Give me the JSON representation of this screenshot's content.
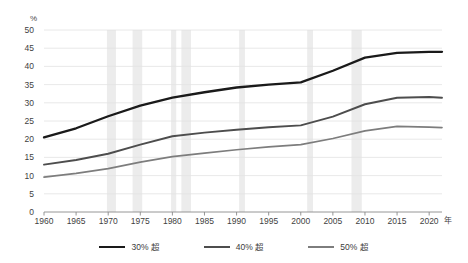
{
  "chart_data": {
    "type": "line",
    "title": "",
    "xlabel": "年",
    "ylabel": "%",
    "xlim": [
      1960,
      2022
    ],
    "ylim": [
      0,
      50
    ],
    "grid": true,
    "legend_position": "bottom",
    "x_ticks": [
      "1960",
      "1965",
      "1970",
      "1975",
      "1980",
      "1985",
      "1990",
      "1995",
      "2000",
      "2005",
      "2010",
      "2015",
      "2020"
    ],
    "y_ticks": [
      "0",
      "5",
      "10",
      "15",
      "20",
      "25",
      "30",
      "35",
      "40",
      "45",
      "50"
    ],
    "x": [
      1960,
      1965,
      1970,
      1975,
      1980,
      1985,
      1990,
      1995,
      2000,
      2005,
      2010,
      2015,
      2020,
      2022
    ],
    "series": [
      {
        "name": "30% 超",
        "color": "#1a1a1a",
        "values": [
          20.5,
          23.0,
          26.3,
          29.2,
          31.4,
          32.9,
          34.2,
          35.0,
          35.6,
          38.8,
          42.4,
          43.7,
          44.0,
          44.0
        ]
      },
      {
        "name": "40% 超",
        "color": "#4d4d4d",
        "values": [
          13.0,
          14.3,
          16.0,
          18.5,
          20.8,
          21.8,
          22.6,
          23.3,
          23.8,
          26.2,
          29.6,
          31.4,
          31.6,
          31.4
        ]
      },
      {
        "name": "50% 超",
        "color": "#7d7d7d",
        "values": [
          9.6,
          10.6,
          11.9,
          13.7,
          15.2,
          16.2,
          17.1,
          17.9,
          18.5,
          20.2,
          22.3,
          23.5,
          23.3,
          23.2
        ]
      }
    ],
    "shaded_bands": [
      {
        "start": 1969.8,
        "end": 1971.2
      },
      {
        "start": 1973.8,
        "end": 1975.3
      },
      {
        "start": 1979.8,
        "end": 1980.6
      },
      {
        "start": 1981.4,
        "end": 1982.9
      },
      {
        "start": 1990.4,
        "end": 1991.3
      },
      {
        "start": 2001.0,
        "end": 2001.9
      },
      {
        "start": 2007.9,
        "end": 2009.5
      }
    ],
    "band_color": "#ececec",
    "grid_color": "#e2e2e2",
    "axis_color": "#8a8a8a"
  },
  "axis": {
    "y_unit": "%",
    "x_unit": "年"
  },
  "legend": {
    "items": [
      {
        "label": "30% 超"
      },
      {
        "label": "40% 超"
      },
      {
        "label": "50% 超"
      }
    ]
  }
}
